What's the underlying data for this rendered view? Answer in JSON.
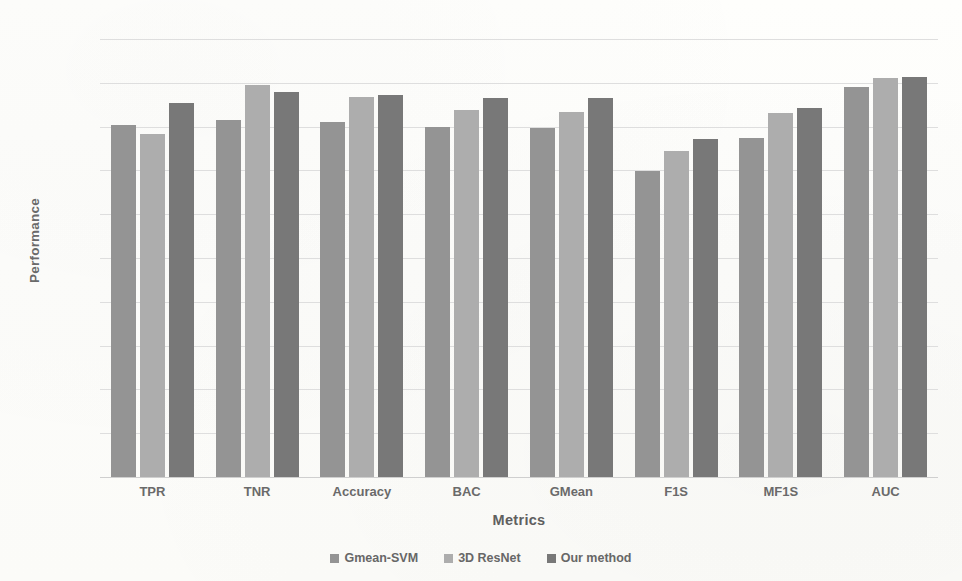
{
  "chart_data": {
    "type": "bar",
    "title": "",
    "subtitle": "",
    "xlabel": "Metrics",
    "ylabel": "Performance",
    "ylim": [
      0,
      100
    ],
    "yticks": [
      0,
      10,
      20,
      30,
      40,
      50,
      60,
      70,
      80,
      90,
      100
    ],
    "ytick_labels": [
      "0",
      "10",
      "20",
      "30",
      "40",
      "50",
      "60",
      "70",
      "80",
      "90",
      "100"
    ],
    "grid": true,
    "grid_axis": "y",
    "legend_position": "bottom-center",
    "categories": [
      "TPR",
      "TNR",
      "Accuracy",
      "BAC",
      "GMean",
      "F1S",
      "MF1S",
      "AUC"
    ],
    "series": [
      {
        "name": "Gmean-SVM",
        "color": "#949494",
        "values": [
          80.4,
          81.5,
          81.0,
          80.0,
          79.7,
          69.8,
          77.5,
          89.0
        ]
      },
      {
        "name": "3D ResNet",
        "color": "#adadad",
        "values": [
          78.2,
          89.5,
          86.8,
          83.8,
          83.4,
          74.5,
          83.0,
          91.1
        ]
      },
      {
        "name": "Our method",
        "color": "#787878",
        "values": [
          85.4,
          87.9,
          87.2,
          86.6,
          86.6,
          77.2,
          84.3,
          91.4
        ]
      }
    ]
  },
  "legend": {
    "items": [
      {
        "label": "Gmean-SVM",
        "swatch": "legend-swatch-gmean-svm"
      },
      {
        "label": "3D ResNet",
        "swatch": "legend-swatch-3d-resnet"
      },
      {
        "label": "Our method",
        "swatch": "legend-swatch-our-method"
      }
    ]
  },
  "colors": {
    "background": "#fdfdfb",
    "gridline": "#dedede",
    "text": "#6a6a6a",
    "series_1": "#949494",
    "series_2": "#adadad",
    "series_3": "#787878"
  }
}
